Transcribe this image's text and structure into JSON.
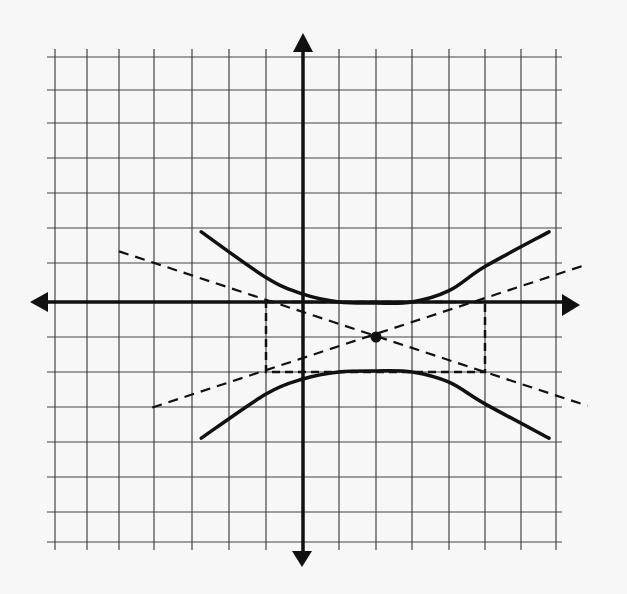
{
  "chart_data": {
    "type": "line",
    "title": "",
    "xlabel": "",
    "ylabel": "",
    "xlim": [
      -7,
      7
    ],
    "ylim": [
      -7,
      7
    ],
    "grid": true,
    "grid_step": 1,
    "axes_arrows": true,
    "tick_labels": false,
    "legend": null,
    "hyperbola": {
      "orientation": "vertical",
      "center": [
        2,
        -1
      ],
      "vertices": [
        [
          2,
          0
        ],
        [
          2,
          -2
        ]
      ],
      "a": 1,
      "b": 3,
      "equation": "(y+1)^2/1 - (x-2)^2/9 = 1"
    },
    "fundamental_rectangle": {
      "x_range": [
        -1,
        5
      ],
      "y_range": [
        -2,
        0
      ],
      "style": "dashed"
    },
    "asymptotes": [
      {
        "slope": 0.3333,
        "through": [
          2,
          -1
        ],
        "x_range": [
          -4,
          8
        ],
        "style": "dashed"
      },
      {
        "slope": -0.3333,
        "through": [
          2,
          -1
        ],
        "x_range": [
          -5,
          8
        ],
        "style": "dashed"
      }
    ],
    "series": [
      {
        "name": "upper-branch",
        "style": "solid",
        "x": [
          -2.75,
          -1,
          0,
          1,
          2,
          3,
          4,
          5,
          6.8
        ],
        "y": [
          1.89,
          0.63,
          0.2,
          0.0,
          -0.03,
          0.0,
          0.29,
          0.91,
          1.89
        ]
      },
      {
        "name": "lower-branch",
        "style": "solid",
        "x": [
          -2.75,
          -1,
          0,
          1,
          2,
          3,
          4,
          5,
          6.8
        ],
        "y": [
          -3.89,
          -2.63,
          -2.2,
          -2.0,
          -1.97,
          -2.0,
          -2.29,
          -2.91,
          -3.89
        ]
      }
    ],
    "colors": {
      "background": "#f7f7f7",
      "grid": "#444444",
      "axes": "#111111",
      "curve": "#111111"
    }
  }
}
